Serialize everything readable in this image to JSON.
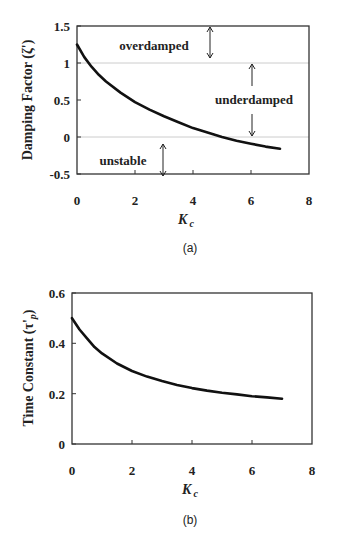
{
  "chart_data": [
    {
      "id": "a",
      "type": "line",
      "panel_label": "(a)",
      "title": "",
      "xlabel": "K_c",
      "ylabel": "Damping Factor (ζ')",
      "xlim": [
        0,
        8
      ],
      "ylim": [
        -0.5,
        1.5
      ],
      "x_ticks": [
        "0",
        "2",
        "4",
        "6",
        "8"
      ],
      "y_ticks": [
        "-0.5",
        "0",
        "0.5",
        "1",
        "1.5"
      ],
      "grid": false,
      "reference_lines": [
        1,
        0
      ],
      "series": [
        {
          "name": "Damping Factor",
          "x": [
            0,
            0.25,
            0.5,
            0.75,
            1,
            1.5,
            2,
            2.5,
            3,
            3.5,
            4,
            4.5,
            5,
            5.5,
            6,
            6.5,
            7
          ],
          "values": [
            1.25,
            1.08,
            0.95,
            0.84,
            0.75,
            0.6,
            0.47,
            0.37,
            0.28,
            0.2,
            0.12,
            0.06,
            0.0,
            -0.05,
            -0.09,
            -0.13,
            -0.16
          ]
        }
      ],
      "annotations": [
        {
          "text": "overdamped",
          "x": 1.6,
          "y": 1.25
        },
        {
          "text": "underdamped",
          "x": 6.0,
          "y": 0.5
        },
        {
          "text": "unstable",
          "x": 1.5,
          "y": -0.3
        }
      ],
      "arrows": [
        {
          "x": 4.5,
          "y_from": 1.5,
          "y_to": 1.02,
          "double": true
        },
        {
          "x": 6.0,
          "y_from": 0.98,
          "y_to": 0.68,
          "direction": "up"
        },
        {
          "x": 6.0,
          "y_from": 0.3,
          "y_to": 0.02,
          "direction": "down"
        },
        {
          "x": 3.0,
          "y_from": -0.02,
          "y_to": -0.5,
          "double": true
        }
      ]
    },
    {
      "id": "b",
      "type": "line",
      "panel_label": "(b)",
      "title": "",
      "xlabel": "K_c",
      "ylabel": "Time Constant (τ'_p)",
      "xlim": [
        0,
        8
      ],
      "ylim": [
        0,
        0.6
      ],
      "x_ticks": [
        "0",
        "2",
        "4",
        "6",
        "8"
      ],
      "y_ticks": [
        "0",
        "0.2",
        "0.4",
        "0.6"
      ],
      "grid": false,
      "series": [
        {
          "name": "Time Constant",
          "x": [
            0,
            0.25,
            0.5,
            0.75,
            1,
            1.5,
            2,
            2.5,
            3,
            3.5,
            4,
            4.5,
            5,
            5.5,
            6,
            6.5,
            7
          ],
          "values": [
            0.5,
            0.455,
            0.42,
            0.385,
            0.36,
            0.32,
            0.29,
            0.268,
            0.25,
            0.235,
            0.222,
            0.212,
            0.204,
            0.197,
            0.19,
            0.185,
            0.18
          ]
        }
      ]
    }
  ],
  "labels": {
    "a": {
      "panel": "(a)",
      "ylabel": "Damping Factor (ζ')",
      "xlabel_main": "K",
      "xlabel_sub": "c",
      "overdamped": "overdamped",
      "underdamped": "underdamped",
      "unstable": "unstable",
      "x_ticks": [
        "0",
        "2",
        "4",
        "6",
        "8"
      ],
      "y_ticks": [
        "1.5",
        "1",
        "0.5",
        "0",
        "-0.5"
      ]
    },
    "b": {
      "panel": "(b)",
      "ylabel_main": "Time Constant (τ'",
      "ylabel_sub": "p",
      "ylabel_close": ")",
      "xlabel_main": "K",
      "xlabel_sub": "c",
      "x_ticks": [
        "0",
        "2",
        "4",
        "6",
        "8"
      ],
      "y_ticks": [
        "0.6",
        "0.4",
        "0.2",
        "0"
      ]
    }
  },
  "colors": {
    "curve": "#111111",
    "frame": "#333333",
    "refline": "#cccccc",
    "text": "#222222"
  }
}
